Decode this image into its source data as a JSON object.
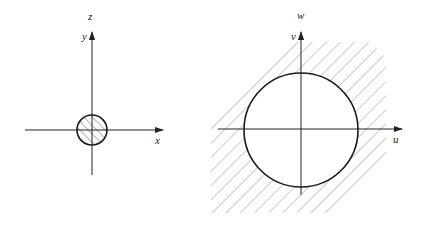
{
  "figure": {
    "left": {
      "axes": {
        "horizontal_label": "x",
        "vertical_label_inner": "y",
        "vertical_label_outer": "z"
      },
      "region": "small hatched disk centered at origin",
      "circle": {
        "cx": 92,
        "cy": 130,
        "r": 15
      }
    },
    "right": {
      "axes": {
        "horizontal_label": "u",
        "vertical_label_inner": "v",
        "vertical_label_outer": "w"
      },
      "region": "hatched exterior of a large circle centered at origin",
      "circle": {
        "cx": 301,
        "cy": 130,
        "r": 57
      }
    }
  },
  "colors": {
    "axis": "#222222",
    "circle": "#1a1a1a",
    "hatch": "#8a8a8a",
    "background": "#ffffff"
  }
}
